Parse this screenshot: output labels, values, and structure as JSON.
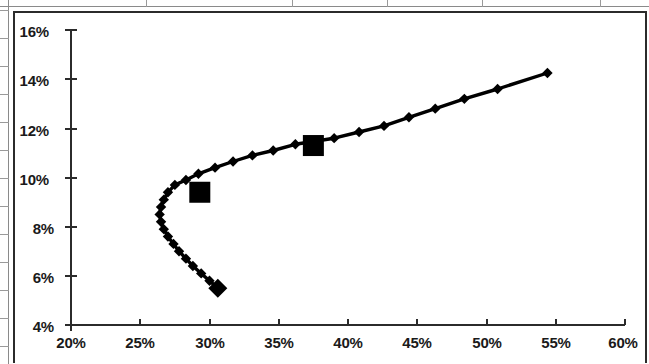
{
  "chart_data": {
    "type": "line",
    "title": "",
    "subtitle": "",
    "xlabel": "",
    "ylabel": "",
    "xlim": [
      20,
      60
    ],
    "ylim": [
      4,
      16
    ],
    "xtick_labels": [
      "20%",
      "25%",
      "30%",
      "35%",
      "40%",
      "45%",
      "50%",
      "55%",
      "60%"
    ],
    "xticks": [
      20,
      25,
      30,
      35,
      40,
      45,
      50,
      55,
      60
    ],
    "ytick_labels": [
      "4%",
      "6%",
      "8%",
      "10%",
      "12%",
      "14%",
      "16%"
    ],
    "yticks": [
      4,
      6,
      8,
      10,
      12,
      14,
      16
    ],
    "grid": false,
    "legend": false,
    "legend_position": "none",
    "series": [
      {
        "name": "frontier",
        "marker": "diamond",
        "color": "#000000",
        "points": [
          {
            "x": 30.6,
            "y": 5.5,
            "marker": "diamond-large"
          },
          {
            "x": 30.0,
            "y": 5.8,
            "marker": "diamond"
          },
          {
            "x": 29.4,
            "y": 6.1,
            "marker": "diamond"
          },
          {
            "x": 28.8,
            "y": 6.4,
            "marker": "diamond"
          },
          {
            "x": 28.3,
            "y": 6.7,
            "marker": "diamond"
          },
          {
            "x": 27.8,
            "y": 7.0,
            "marker": "diamond"
          },
          {
            "x": 27.4,
            "y": 7.3,
            "marker": "diamond"
          },
          {
            "x": 27.0,
            "y": 7.6,
            "marker": "diamond"
          },
          {
            "x": 26.7,
            "y": 7.9,
            "marker": "diamond"
          },
          {
            "x": 26.5,
            "y": 8.2,
            "marker": "diamond"
          },
          {
            "x": 26.4,
            "y": 8.5,
            "marker": "diamond"
          },
          {
            "x": 26.5,
            "y": 8.8,
            "marker": "diamond"
          },
          {
            "x": 26.7,
            "y": 9.1,
            "marker": "diamond"
          },
          {
            "x": 27.0,
            "y": 9.4,
            "marker": "diamond"
          },
          {
            "x": 27.5,
            "y": 9.7,
            "marker": "diamond"
          },
          {
            "x": 29.3,
            "y": 9.4,
            "marker": "square-large"
          },
          {
            "x": 28.3,
            "y": 9.9,
            "marker": "diamond"
          },
          {
            "x": 29.2,
            "y": 10.15,
            "marker": "diamond"
          },
          {
            "x": 30.4,
            "y": 10.4,
            "marker": "diamond"
          },
          {
            "x": 31.7,
            "y": 10.65,
            "marker": "diamond"
          },
          {
            "x": 33.1,
            "y": 10.9,
            "marker": "diamond"
          },
          {
            "x": 34.6,
            "y": 11.1,
            "marker": "diamond"
          },
          {
            "x": 37.5,
            "y": 11.3,
            "marker": "square-large"
          },
          {
            "x": 36.2,
            "y": 11.35,
            "marker": "diamond"
          },
          {
            "x": 39.0,
            "y": 11.6,
            "marker": "diamond"
          },
          {
            "x": 40.8,
            "y": 11.85,
            "marker": "diamond"
          },
          {
            "x": 42.6,
            "y": 12.1,
            "marker": "diamond"
          },
          {
            "x": 44.4,
            "y": 12.45,
            "marker": "diamond"
          },
          {
            "x": 46.3,
            "y": 12.8,
            "marker": "diamond"
          },
          {
            "x": 48.4,
            "y": 13.2,
            "marker": "diamond"
          },
          {
            "x": 50.8,
            "y": 13.6,
            "marker": "diamond"
          },
          {
            "x": 54.4,
            "y": 14.25,
            "marker": "diamond"
          }
        ]
      }
    ],
    "highlight_markers": [
      {
        "x": 30.6,
        "y": 5.5,
        "shape": "diamond"
      },
      {
        "x": 29.3,
        "y": 9.4,
        "shape": "square"
      },
      {
        "x": 37.5,
        "y": 11.3,
        "shape": "square"
      }
    ]
  }
}
